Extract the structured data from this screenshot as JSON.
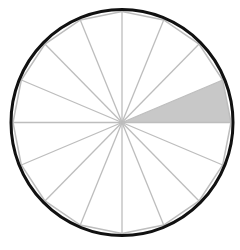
{
  "diagram": {
    "type": "fraction-circle",
    "total_parts": 16,
    "shaded_parts": [
      0
    ],
    "shaded_fraction": "1/16",
    "colors": {
      "outline": "#111111",
      "spoke": "#bdbdbd",
      "shade": "#c8c8c8",
      "background": "#ffffff"
    }
  }
}
